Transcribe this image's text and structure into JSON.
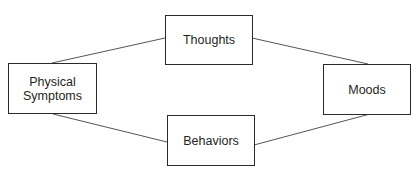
{
  "diagram": {
    "nodes": {
      "thoughts": {
        "label": "Thoughts"
      },
      "physical": {
        "label": "Physical Symptoms",
        "line1": "Physical",
        "line2": "Symptoms"
      },
      "moods": {
        "label": "Moods"
      },
      "behaviors": {
        "label": "Behaviors"
      }
    },
    "edges": [
      {
        "from": "Physical Symptoms",
        "to": "Thoughts"
      },
      {
        "from": "Thoughts",
        "to": "Moods"
      },
      {
        "from": "Physical Symptoms",
        "to": "Behaviors"
      },
      {
        "from": "Behaviors",
        "to": "Moods"
      }
    ],
    "colors": {
      "line": "#555555",
      "border": "#2a2a2a",
      "text": "#1f1f1f"
    }
  }
}
